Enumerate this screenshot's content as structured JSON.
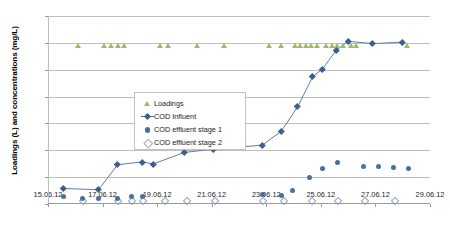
{
  "chart_data": {
    "type": "scatter",
    "title": "",
    "xlabel": "",
    "ylabel": "Loadings (L) and concentrations (mg/L)",
    "ylim": [
      0,
      700
    ],
    "ytick_labels": [
      "0",
      "100",
      "200",
      "300",
      "400",
      "500",
      "600",
      "700"
    ],
    "ytick_values": [
      0,
      100,
      200,
      300,
      400,
      500,
      600,
      700
    ],
    "xtick_labels": [
      "15.06.12",
      "17.06.12",
      "19.06.12",
      "21.06.12",
      "23.06.12",
      "25.06.12",
      "27.06.12",
      "29.06.12"
    ],
    "xlim_days": [
      0,
      14
    ],
    "grid": "horizontal",
    "legend_position": "inside-upper-left",
    "colors": {
      "loadings": "#9cb96b",
      "cod_influent": "#3c5f8f",
      "cod_effluent_stage_1": "#4a6f9c",
      "cod_effluent_stage_2": "#8ea9c8",
      "gridline": "#bfbfbf",
      "axis": "#9a9a9a",
      "background": "#ffffff"
    },
    "series": [
      {
        "name": "Loadings",
        "marker": "triangle",
        "color": "#9cb96b",
        "points": [
          {
            "x": 1.1,
            "y": 580
          },
          {
            "x": 2.05,
            "y": 580
          },
          {
            "x": 2.3,
            "y": 580
          },
          {
            "x": 2.55,
            "y": 580
          },
          {
            "x": 2.8,
            "y": 580
          },
          {
            "x": 4.1,
            "y": 580
          },
          {
            "x": 4.4,
            "y": 580
          },
          {
            "x": 5.45,
            "y": 580
          },
          {
            "x": 6.45,
            "y": 580
          },
          {
            "x": 8.1,
            "y": 580
          },
          {
            "x": 8.55,
            "y": 580
          },
          {
            "x": 9.05,
            "y": 580
          },
          {
            "x": 9.25,
            "y": 580
          },
          {
            "x": 9.45,
            "y": 580
          },
          {
            "x": 9.65,
            "y": 580
          },
          {
            "x": 9.85,
            "y": 580
          },
          {
            "x": 10.2,
            "y": 580
          },
          {
            "x": 10.4,
            "y": 580
          },
          {
            "x": 10.6,
            "y": 580
          },
          {
            "x": 10.8,
            "y": 580
          },
          {
            "x": 11.1,
            "y": 580
          },
          {
            "x": 11.28,
            "y": 580
          },
          {
            "x": 13.15,
            "y": 580
          }
        ]
      },
      {
        "name": "COD Influent",
        "marker": "diamond-line",
        "color": "#3c5f8f",
        "points": [
          {
            "x": 0.55,
            "y": 58
          },
          {
            "x": 1.85,
            "y": 53
          },
          {
            "x": 2.55,
            "y": 146
          },
          {
            "x": 3.45,
            "y": 157
          },
          {
            "x": 3.85,
            "y": 149
          },
          {
            "x": 5.0,
            "y": 192
          },
          {
            "x": 6.05,
            "y": 204
          },
          {
            "x": 7.85,
            "y": 219
          },
          {
            "x": 8.55,
            "y": 271
          },
          {
            "x": 9.15,
            "y": 362
          },
          {
            "x": 9.7,
            "y": 474
          },
          {
            "x": 10.05,
            "y": 501
          },
          {
            "x": 10.55,
            "y": 571
          },
          {
            "x": 11.0,
            "y": 606
          },
          {
            "x": 11.9,
            "y": 597
          },
          {
            "x": 13.0,
            "y": 603
          }
        ]
      },
      {
        "name": "COD effluent stage 1",
        "marker": "circle",
        "color": "#4a6f9c",
        "points": [
          {
            "x": 0.55,
            "y": 29
          },
          {
            "x": 1.25,
            "y": 21
          },
          {
            "x": 1.85,
            "y": 22
          },
          {
            "x": 2.55,
            "y": 21
          },
          {
            "x": 3.05,
            "y": 28
          },
          {
            "x": 3.45,
            "y": 27
          },
          {
            "x": 7.85,
            "y": 34
          },
          {
            "x": 8.55,
            "y": 33
          },
          {
            "x": 8.95,
            "y": 50
          },
          {
            "x": 9.6,
            "y": 97
          },
          {
            "x": 10.05,
            "y": 133
          },
          {
            "x": 10.6,
            "y": 154
          },
          {
            "x": 11.55,
            "y": 141
          },
          {
            "x": 12.1,
            "y": 139
          },
          {
            "x": 12.65,
            "y": 136
          },
          {
            "x": 13.2,
            "y": 134
          }
        ]
      },
      {
        "name": "COD effluent stage 2",
        "marker": "open-diamond",
        "color": "#8ea9c8",
        "points": [
          {
            "x": 1.25,
            "y": 14
          },
          {
            "x": 2.55,
            "y": 13
          },
          {
            "x": 3.05,
            "y": 15
          },
          {
            "x": 3.45,
            "y": 13
          },
          {
            "x": 4.25,
            "y": 14
          },
          {
            "x": 5.05,
            "y": 14
          },
          {
            "x": 6.1,
            "y": 14
          },
          {
            "x": 7.85,
            "y": 14
          },
          {
            "x": 8.6,
            "y": 14
          },
          {
            "x": 9.65,
            "y": 15
          },
          {
            "x": 10.6,
            "y": 16
          },
          {
            "x": 11.6,
            "y": 16
          },
          {
            "x": 12.7,
            "y": 16
          }
        ]
      }
    ]
  },
  "legend": {
    "items": [
      {
        "label": "Loadings",
        "marker": "triangle"
      },
      {
        "label": "COD Influent",
        "marker": "diamond-line"
      },
      {
        "label": "COD effluent stage 1",
        "marker": "circle"
      },
      {
        "label": "COD effluent stage 2",
        "marker": "open-diamond"
      }
    ]
  }
}
